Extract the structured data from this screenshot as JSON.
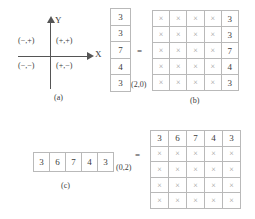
{
  "panel_a": {
    "caption": "(a)",
    "y_axis_label": "Y",
    "x_axis_label": "X",
    "quadrants": [
      {
        "name": "quadrant-2",
        "label": "(−,+)"
      },
      {
        "name": "quadrant-1",
        "label": "(+,+)"
      },
      {
        "name": "quadrant-3",
        "label": "(−,−)"
      },
      {
        "name": "quadrant-4",
        "label": "(+,−)"
      }
    ]
  },
  "panel_b": {
    "caption": "(b)",
    "equals": "=",
    "column_vector": {
      "values": [
        "3",
        "3",
        "7",
        "4",
        "3"
      ],
      "index_label": "(2,0)"
    },
    "grid": {
      "rows": 5,
      "cols": 5,
      "cells": [
        [
          "×",
          "×",
          "×",
          "×",
          "3"
        ],
        [
          "×",
          "×",
          "×",
          "×",
          "3"
        ],
        [
          "×",
          "×",
          "×",
          "×",
          "7"
        ],
        [
          "×",
          "×",
          "×",
          "×",
          "4"
        ],
        [
          "×",
          "×",
          "×",
          "×",
          "3"
        ]
      ]
    }
  },
  "panel_c": {
    "caption": "(c)",
    "equals": "=",
    "row_vector": {
      "values": [
        "3",
        "6",
        "7",
        "4",
        "3"
      ],
      "index_label": "(0,2)"
    },
    "grid": {
      "rows": 5,
      "cols": 5,
      "cells": [
        [
          "3",
          "6",
          "7",
          "4",
          "3"
        ],
        [
          "×",
          "×",
          "×",
          "×",
          "×"
        ],
        [
          "×",
          "×",
          "×",
          "×",
          "×"
        ],
        [
          "×",
          "×",
          "×",
          "×",
          "×"
        ],
        [
          "×",
          "×",
          "×",
          "×",
          "×"
        ]
      ]
    }
  },
  "colors": {
    "cell_border": "#b9b9b9",
    "axis": "#555555",
    "text": "#3b3b3b",
    "cross": "#9a9a9a"
  }
}
